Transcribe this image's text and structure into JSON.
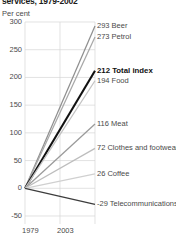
{
  "chart_data": {
    "type": "line",
    "title": "services, 1979-2002",
    "subtitle": "",
    "ylabel": "Per cent",
    "xlabel": "",
    "x": [
      "1979",
      "2003"
    ],
    "xlim": [
      1979,
      2003
    ],
    "ylim": [
      -50,
      300
    ],
    "yticks": [
      "300",
      "250",
      "200",
      "150",
      "100",
      "50",
      "0",
      "-50"
    ],
    "ytick_values": [
      300,
      250,
      200,
      150,
      100,
      50,
      0,
      -50
    ],
    "xticks": [
      "1979",
      "2003"
    ],
    "grid": true,
    "legend": "inline-right-labels",
    "series": [
      {
        "name": "Beer",
        "label": "293 Beer",
        "values": [
          0,
          293
        ],
        "end_value": 293,
        "color": "#8f8f8f",
        "highlight": false
      },
      {
        "name": "Petrol",
        "label": "273 Petrol",
        "values": [
          0,
          273
        ],
        "end_value": 273,
        "color": "#a8a8a8",
        "highlight": false
      },
      {
        "name": "Total index",
        "label": "212 Total index",
        "values": [
          0,
          212
        ],
        "end_value": 212,
        "color": "#111111",
        "highlight": true
      },
      {
        "name": "Food",
        "label": "194 Food",
        "values": [
          0,
          194
        ],
        "end_value": 194,
        "color": "#c2c2c2",
        "highlight": false
      },
      {
        "name": "Meat",
        "label": "116 Meat",
        "values": [
          0,
          116
        ],
        "end_value": 116,
        "color": "#9a9a9a",
        "highlight": false
      },
      {
        "name": "Clothes and footwear",
        "label": "72 Clothes and footwear",
        "values": [
          0,
          72
        ],
        "end_value": 72,
        "color": "#bdbdbd",
        "highlight": false
      },
      {
        "name": "Coffee",
        "label": "26 Coffee",
        "values": [
          0,
          26
        ],
        "end_value": 26,
        "color": "#d0d0d0",
        "highlight": false
      },
      {
        "name": "Telecommunications",
        "label": "-29 Telecommunications",
        "values": [
          0,
          -29
        ],
        "end_value": -29,
        "color": "#3d3d3d",
        "highlight": false
      }
    ]
  }
}
